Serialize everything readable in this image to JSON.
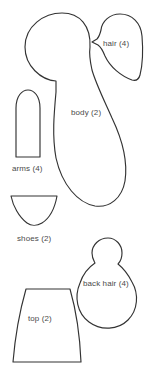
{
  "sheet": {
    "title": "Doll Pattern Sheet",
    "background_color": "#ffffff",
    "outline_color": "#333333",
    "label_color": "#4a4a4a",
    "width": 156,
    "height": 379
  },
  "pieces": [
    {
      "id": "body",
      "label": "body (2)",
      "name": "body",
      "quantity": 2,
      "label_x": 71,
      "label_y": 109
    },
    {
      "id": "hair",
      "label": "hair (4)",
      "name": "hair",
      "quantity": 4,
      "label_x": 103,
      "label_y": 40
    },
    {
      "id": "arms",
      "label": "arms (4)",
      "name": "arms",
      "quantity": 4,
      "label_x": 12,
      "label_y": 165
    },
    {
      "id": "shoes",
      "label": "shoes (2)",
      "name": "shoes",
      "quantity": 2,
      "label_x": 17,
      "label_y": 235
    },
    {
      "id": "back-hair",
      "label": "back hair (4)",
      "name": "back hair",
      "quantity": 4,
      "label_x": 83,
      "label_y": 280
    },
    {
      "id": "top",
      "label": "top (2)",
      "name": "top",
      "quantity": 2,
      "label_x": 28,
      "label_y": 315
    }
  ]
}
